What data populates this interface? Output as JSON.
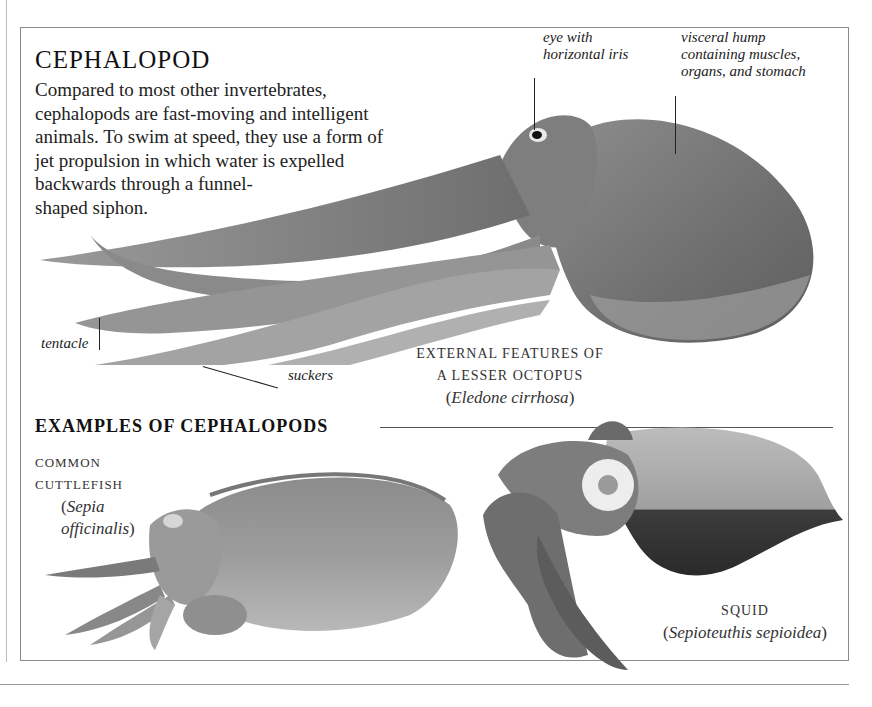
{
  "page": {
    "title": "CEPHALOPOD",
    "intro_lines": [
      "Compared to most other invertebrates,",
      "cephalopods are fast-moving and intelligent",
      "animals. To swim at speed, they use a form of",
      "jet propulsion in which water is expelled",
      "backwards through a funnel-",
      "shaped siphon."
    ]
  },
  "octopus": {
    "labels": {
      "eye": [
        "eye with",
        "horizontal iris"
      ],
      "visceral_hump": [
        "visceral hump",
        "containing muscles,",
        "organs, and stomach"
      ],
      "tentacle": "tentacle",
      "suckers": "suckers"
    },
    "caption": {
      "line1": "EXTERNAL FEATURES OF",
      "line2": "A LESSER OCTOPUS",
      "sci_name": "Eledone cirrhosa"
    }
  },
  "examples": {
    "heading": "EXAMPLES OF CEPHALOPODS",
    "cuttlefish": {
      "name": "COMMON CUTTLEFISH",
      "sci_name": "Sepia officinalis"
    },
    "squid": {
      "name": "SQUID",
      "sci_name": "Sepioteuthis sepioidea"
    }
  },
  "colors": {
    "border": "#8a8a8a",
    "text": "#222222",
    "illustration_gray": "#7a7a7a"
  }
}
